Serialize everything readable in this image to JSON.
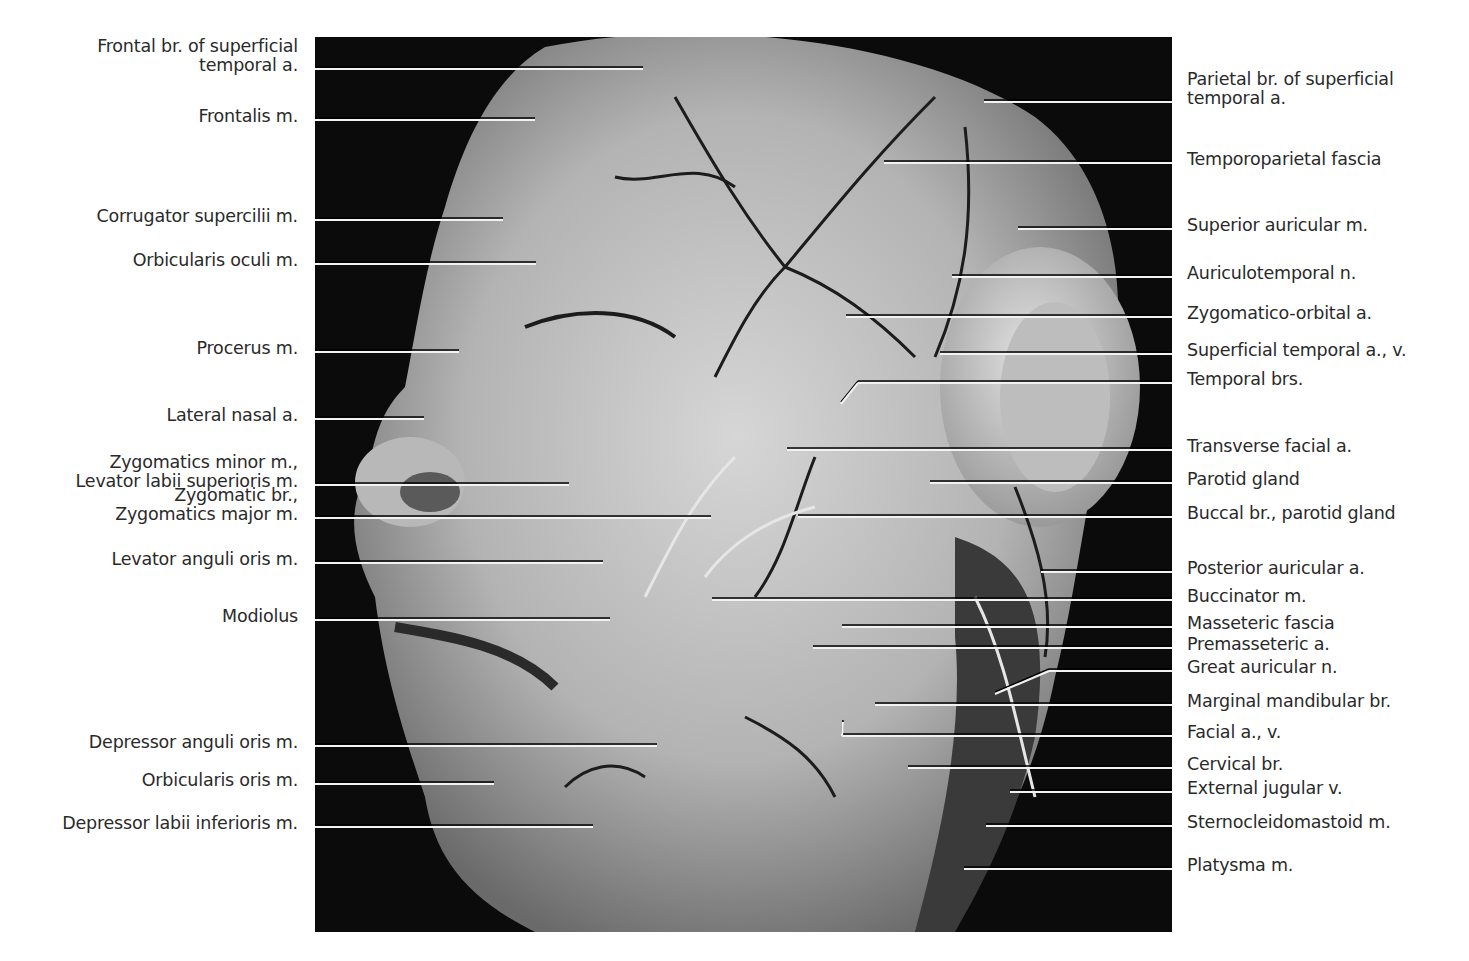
{
  "figure": {
    "type": "anatomical-photograph",
    "caption_partial": "(cropped caption text at bottom edge, mostly cut off)"
  },
  "labels_left": [
    {
      "text": "Frontal br. of superficial\ntemporal a.",
      "line_y": 69,
      "end_x": 643
    },
    {
      "text": "Frontalis m.",
      "line_y": 120,
      "end_x": 535
    },
    {
      "text": "Corrugator supercilii m.",
      "line_y": 220,
      "end_x": 503
    },
    {
      "text": "Orbicularis oculi m.",
      "line_y": 264,
      "end_x": 536
    },
    {
      "text": "Procerus m.",
      "line_y": 352,
      "end_x": 459
    },
    {
      "text": "Lateral nasal a.",
      "line_y": 419,
      "end_x": 424
    },
    {
      "text": "Zygomatics minor m.,\nLevator labii superioris m.",
      "line_y": 485,
      "end_x": 569
    },
    {
      "text": "Zygomatic br.,\nZygomatics major m.",
      "line_y": 518,
      "end_x": 711
    },
    {
      "text": "Levator anguli oris m.",
      "line_y": 563,
      "end_x": 603
    },
    {
      "text": "Modiolus",
      "line_y": 620,
      "end_x": 610
    },
    {
      "text": "Depressor anguli oris m.",
      "line_y": 746,
      "end_x": 657
    },
    {
      "text": "Orbicularis oris m.",
      "line_y": 784,
      "end_x": 494
    },
    {
      "text": "Depressor labii inferioris m.",
      "line_y": 827,
      "end_x": 593
    }
  ],
  "labels_right": [
    {
      "text": "Parietal br. of superficial\ntemporal a.",
      "line_y": 102,
      "end_x": 984
    },
    {
      "text": "Temporoparietal fascia",
      "line_y": 163,
      "end_x": 884
    },
    {
      "text": "Superior auricular m.",
      "line_y": 229,
      "end_x": 1018
    },
    {
      "text": "Auriculotemporal n.",
      "line_y": 277,
      "end_x": 952
    },
    {
      "text": "Zygomatico-orbital a.",
      "line_y": 317,
      "end_x": 846
    },
    {
      "text": "Superficial temporal a., v.",
      "line_y": 354,
      "end_x": 940
    },
    {
      "text": "Temporal brs.",
      "line_y": 383,
      "end_x": 858,
      "bend_to": [
        841,
        404
      ]
    },
    {
      "text": "Transverse facial a.",
      "line_y": 450,
      "end_x": 787
    },
    {
      "text": "Parotid gland",
      "line_y": 483,
      "end_x": 930
    },
    {
      "text": "Buccal br., parotid gland",
      "line_y": 517,
      "end_x": 798
    },
    {
      "text": "Posterior auricular a.",
      "line_y": 572,
      "end_x": 1041
    },
    {
      "text": "Buccinator m.",
      "line_y": 600,
      "end_x": 712
    },
    {
      "text": "Masseteric fascia",
      "line_y": 627,
      "end_x": 842
    },
    {
      "text": "Premasseteric a.",
      "line_y": 648,
      "end_x": 813
    },
    {
      "text": "Great auricular n.",
      "line_y": 671,
      "end_x": 1049,
      "bend_to": [
        995,
        694
      ]
    },
    {
      "text": "Marginal mandibular br.",
      "line_y": 705,
      "end_x": 875
    },
    {
      "text": "Facial a., v.",
      "line_y": 736,
      "end_x": 842,
      "bend_to": [
        843,
        722
      ]
    },
    {
      "text": "Cervical br.",
      "line_y": 768,
      "end_x": 908
    },
    {
      "text": "External jugular v.",
      "line_y": 792,
      "end_x": 1010
    },
    {
      "text": "Sternocleidomastoid m.",
      "line_y": 826,
      "end_x": 986
    },
    {
      "text": "Platysma m.",
      "line_y": 869,
      "end_x": 964
    }
  ],
  "colors": {
    "background": "#ffffff",
    "photo_background": "#0b0b0b",
    "tissue_light": "#c9c9c9",
    "tissue_mid": "#9a9a9a",
    "vessel_dark": "#1c1c1c",
    "leader_line": "#f2f2f2",
    "label_text": "#2a2a2a"
  }
}
